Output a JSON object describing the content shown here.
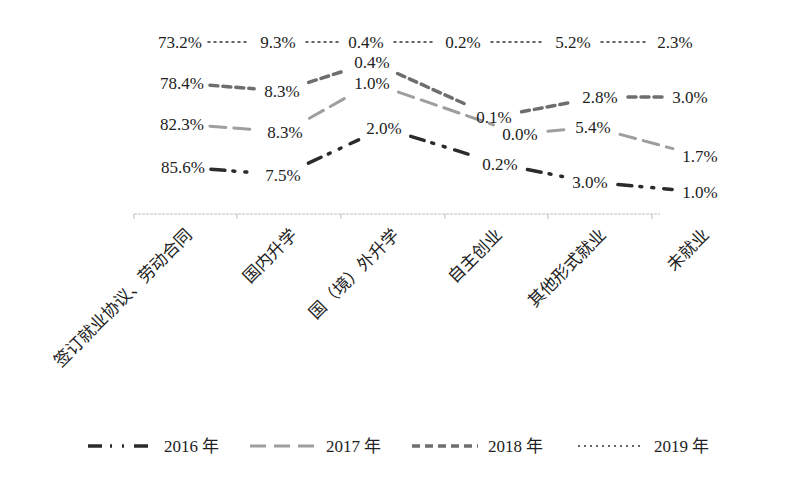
{
  "chart_data": {
    "type": "line",
    "title": "",
    "xlabel": "",
    "ylabel": "",
    "grid": false,
    "legend_position": "bottom",
    "categories": [
      "签订就业协议、劳动合同",
      "国内升学",
      "国（境）外升学",
      "自主创业",
      "其他形式就业",
      "未就业"
    ],
    "series": [
      {
        "name": "2016 年",
        "color": "#2b2b2b",
        "style": "long-dash-dot-dot",
        "values": [
          85.6,
          7.5,
          2.0,
          0.2,
          3.0,
          1.0
        ],
        "labels": [
          "85.6%",
          "7.5%",
          "2.0%",
          "0.2%",
          "3.0%",
          "1.0%"
        ]
      },
      {
        "name": "2017 年",
        "color": "#9e9e9e",
        "style": "long-dash",
        "values": [
          82.3,
          8.3,
          1.0,
          0.0,
          5.4,
          1.7
        ],
        "labels": [
          "82.3%",
          "8.3%",
          "1.0%",
          "0.0%",
          "5.4%",
          "1.7%"
        ]
      },
      {
        "name": "2018 年",
        "color": "#6e6e6e",
        "style": "dash",
        "values": [
          78.4,
          8.3,
          0.4,
          0.1,
          2.8,
          3.0
        ],
        "labels": [
          "78.4%",
          "8.3%",
          "0.4%",
          "0.1%",
          "2.8%",
          "3.0%"
        ]
      },
      {
        "name": "2019 年",
        "color": "#333333",
        "style": "dot",
        "values": [
          73.2,
          9.3,
          0.4,
          0.2,
          5.2,
          2.3
        ],
        "labels": [
          "73.2%",
          "9.3%",
          "0.4%",
          "0.2%",
          "5.2%",
          "2.3%"
        ]
      }
    ]
  }
}
